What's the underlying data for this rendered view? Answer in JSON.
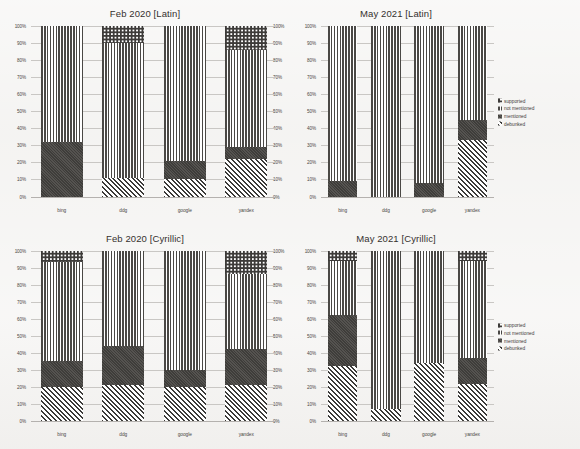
{
  "figure": {
    "background": "#f2f1ef",
    "ink": "#3b3a38"
  },
  "legend": {
    "items": [
      {
        "label": "supported",
        "pattern": "checkered"
      },
      {
        "label": "not mentioned",
        "pattern": "vertical-stripes"
      },
      {
        "label": "mentioned",
        "pattern": "solid-dark"
      },
      {
        "label": "debunked",
        "pattern": "diagonal-stripes"
      }
    ]
  },
  "y_ticks": [
    "100%",
    "90%",
    "80%",
    "70%",
    "60%",
    "50%",
    "40%",
    "30%",
    "20%",
    "10%",
    "0%"
  ],
  "chart_data": [
    {
      "type": "bar",
      "stacked": true,
      "normalized": "100%",
      "title": "Feb 2020 [Latin]",
      "xlabel": "",
      "ylabel": "",
      "ylim": [
        0,
        100
      ],
      "grid": true,
      "legend_position": "none",
      "categories": [
        "bing",
        "ddg",
        "google",
        "yandex"
      ],
      "series": [
        {
          "name": "debunked",
          "values": [
            0,
            11,
            10,
            22
          ]
        },
        {
          "name": "mentioned",
          "values": [
            32,
            0,
            11,
            7
          ]
        },
        {
          "name": "not mentioned",
          "values": [
            68,
            79,
            79,
            57
          ]
        },
        {
          "name": "supported",
          "values": [
            0,
            10,
            0,
            14
          ]
        }
      ]
    },
    {
      "type": "bar",
      "stacked": true,
      "normalized": "100%",
      "title": "May 2021 [Latin]",
      "xlabel": "",
      "ylabel": "",
      "ylim": [
        0,
        100
      ],
      "grid": true,
      "legend_position": "right",
      "categories": [
        "bing",
        "ddg",
        "google",
        "yandex"
      ],
      "series": [
        {
          "name": "debunked",
          "values": [
            0,
            0,
            0,
            33
          ]
        },
        {
          "name": "mentioned",
          "values": [
            9,
            0,
            8,
            12
          ]
        },
        {
          "name": "not mentioned",
          "values": [
            91,
            100,
            92,
            55
          ]
        },
        {
          "name": "supported",
          "values": [
            0,
            0,
            0,
            0
          ]
        }
      ]
    },
    {
      "type": "bar",
      "stacked": true,
      "normalized": "100%",
      "title": "Feb 2020 [Cyrillic]",
      "xlabel": "",
      "ylabel": "",
      "ylim": [
        0,
        100
      ],
      "grid": true,
      "legend_position": "none",
      "categories": [
        "bing",
        "ddg",
        "google",
        "yandex"
      ],
      "series": [
        {
          "name": "debunked",
          "values": [
            20,
            21,
            20,
            21
          ]
        },
        {
          "name": "mentioned",
          "values": [
            15,
            23,
            10,
            21
          ]
        },
        {
          "name": "not mentioned",
          "values": [
            58,
            56,
            70,
            44
          ]
        },
        {
          "name": "supported",
          "values": [
            7,
            0,
            0,
            14
          ]
        }
      ]
    },
    {
      "type": "bar",
      "stacked": true,
      "normalized": "100%",
      "title": "May 2021 [Cyrillic]",
      "xlabel": "",
      "ylabel": "",
      "ylim": [
        0,
        100
      ],
      "grid": true,
      "legend_position": "right",
      "categories": [
        "bing",
        "ddg",
        "google",
        "yandex"
      ],
      "series": [
        {
          "name": "debunked",
          "values": [
            32,
            7,
            34,
            22
          ]
        },
        {
          "name": "mentioned",
          "values": [
            30,
            0,
            0,
            15
          ]
        },
        {
          "name": "not mentioned",
          "values": [
            32,
            93,
            66,
            57
          ]
        },
        {
          "name": "supported",
          "values": [
            6,
            0,
            0,
            6
          ]
        }
      ]
    }
  ]
}
